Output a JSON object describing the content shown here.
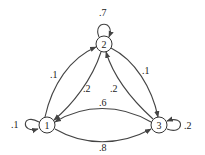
{
  "diagram": {
    "type": "markov-chain",
    "nodes": [
      {
        "id": "1",
        "label": "1"
      },
      {
        "id": "2",
        "label": "2"
      },
      {
        "id": "3",
        "label": "3"
      }
    ],
    "edges": [
      {
        "from": "1",
        "to": "1",
        "label": ".1"
      },
      {
        "from": "1",
        "to": "2",
        "label": ".1"
      },
      {
        "from": "1",
        "to": "3",
        "label": ".8"
      },
      {
        "from": "2",
        "to": "2",
        "label": ".7"
      },
      {
        "from": "2",
        "to": "1",
        "label": ".2"
      },
      {
        "from": "2",
        "to": "3",
        "label": ".1"
      },
      {
        "from": "3",
        "to": "3",
        "label": ".2"
      },
      {
        "from": "3",
        "to": "1",
        "label": ".6"
      },
      {
        "from": "3",
        "to": "2",
        "label": ".2"
      }
    ],
    "colors": {
      "stroke": "#444444",
      "background": "#ffffff"
    }
  }
}
